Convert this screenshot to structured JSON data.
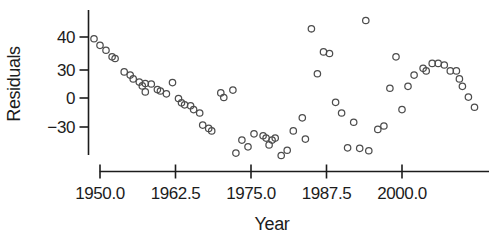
{
  "chart_data": {
    "type": "scatter",
    "title": "",
    "xlabel": "Year",
    "ylabel": "Residuals",
    "grid": false,
    "legend": null,
    "marker": "open-circle",
    "x_range": [
      1948,
      2013
    ],
    "y_tick_spacing": "equal",
    "x_ticks": [
      {
        "value": 1950.0,
        "label": "1950.0"
      },
      {
        "value": 1962.5,
        "label": "1962.5"
      },
      {
        "value": 1975.0,
        "label": "1975.0"
      },
      {
        "value": 1987.5,
        "label": "1987.5"
      },
      {
        "value": 2000.0,
        "label": "2000.0"
      }
    ],
    "y_ticks": [
      {
        "value": 40,
        "label": "40"
      },
      {
        "value": 30,
        "label": "30"
      },
      {
        "value": 0,
        "label": "0"
      },
      {
        "value": -30,
        "label": "−30"
      }
    ],
    "points": [
      [
        1949,
        39.5
      ],
      [
        1950,
        37.5
      ],
      [
        1951,
        36
      ],
      [
        1952,
        34
      ],
      [
        1952.5,
        33.5
      ],
      [
        1954,
        28
      ],
      [
        1955,
        24.5
      ],
      [
        1955.5,
        20.5
      ],
      [
        1956.5,
        17
      ],
      [
        1957,
        13
      ],
      [
        1957.5,
        15.5
      ],
      [
        1957.5,
        6.5
      ],
      [
        1958.5,
        15
      ],
      [
        1959.5,
        9
      ],
      [
        1960,
        7.5
      ],
      [
        1961,
        4.5
      ],
      [
        1962,
        16.5
      ],
      [
        1963,
        -0.5
      ],
      [
        1963.5,
        -5
      ],
      [
        1964,
        -7
      ],
      [
        1965,
        -8
      ],
      [
        1965.5,
        -12
      ],
      [
        1966.5,
        -15.5
      ],
      [
        1967,
        -28
      ],
      [
        1968,
        -31.5
      ],
      [
        1968.5,
        -34
      ],
      [
        1970,
        5.5
      ],
      [
        1970.5,
        0.5
      ],
      [
        1972,
        8.5
      ],
      [
        1972.5,
        -57
      ],
      [
        1973.5,
        -43.5
      ],
      [
        1974.5,
        -50.5
      ],
      [
        1975.5,
        -37
      ],
      [
        1977,
        -39
      ],
      [
        1977.5,
        -41.5
      ],
      [
        1978,
        -48.5
      ],
      [
        1978.5,
        -43.5
      ],
      [
        1979,
        -41.5
      ],
      [
        1980,
        -59.5
      ],
      [
        1981,
        -54
      ],
      [
        1982,
        -34
      ],
      [
        1983.5,
        -20.5
      ],
      [
        1984,
        -42.5
      ],
      [
        1985,
        42.5
      ],
      [
        1986,
        26
      ],
      [
        1987,
        35.5
      ],
      [
        1988,
        35
      ],
      [
        1989,
        -4.5
      ],
      [
        1990,
        -15.5
      ],
      [
        1991,
        -51.5
      ],
      [
        1992,
        -25
      ],
      [
        1993,
        -52
      ],
      [
        1994,
        45
      ],
      [
        1994.5,
        -54.5
      ],
      [
        1996,
        -32.5
      ],
      [
        1997,
        -29
      ],
      [
        1998,
        10.5
      ],
      [
        1999,
        34
      ],
      [
        2000,
        -12
      ],
      [
        2001,
        12.5
      ],
      [
        2002,
        24.5
      ],
      [
        2003.5,
        30.5
      ],
      [
        2004,
        29
      ],
      [
        2005,
        32
      ],
      [
        2006,
        32
      ],
      [
        2007,
        31.5
      ],
      [
        2008,
        29
      ],
      [
        2009,
        29
      ],
      [
        2009.5,
        20.5
      ],
      [
        2010,
        12.5
      ],
      [
        2011,
        1
      ],
      [
        2012,
        -9.5
      ]
    ]
  },
  "colors": {
    "background": "#ffffff",
    "axis": "#1c1c1c",
    "text": "#1c1c1c",
    "marker_stroke": "#4d4d4d"
  }
}
